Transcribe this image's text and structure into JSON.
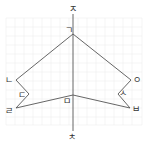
{
  "diagram": {
    "type": "symmetric-figure-on-grid",
    "colors": {
      "line": "#555555",
      "grid": "#eeeeee",
      "label": "#333333"
    },
    "axis": {
      "top_label": "ㅈ",
      "bottom_label": "ㅊ"
    },
    "points": [
      {
        "id": "g",
        "label": "ㄱ"
      },
      {
        "id": "n",
        "label": "ㄴ"
      },
      {
        "id": "d",
        "label": "ㄷ"
      },
      {
        "id": "r",
        "label": "ㄹ"
      },
      {
        "id": "m",
        "label": "ㅁ"
      },
      {
        "id": "b",
        "label": "ㅂ"
      },
      {
        "id": "s",
        "label": "ㅅ"
      },
      {
        "id": "o",
        "label": "ㅇ"
      }
    ]
  }
}
